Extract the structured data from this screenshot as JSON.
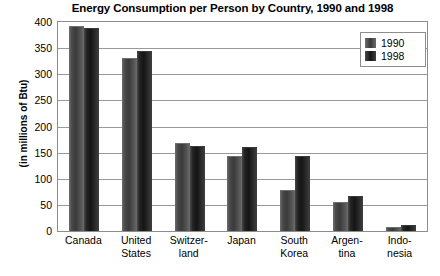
{
  "chart_data": {
    "type": "bar",
    "title": "Energy Consumption per Person by Country, 1990 and 1998",
    "xlabel": "",
    "ylabel": "(in millions of Btu)",
    "ylim": [
      0,
      400
    ],
    "ytick_step": 50,
    "yticks": [
      400,
      350,
      300,
      250,
      200,
      150,
      100,
      50,
      0
    ],
    "grid": true,
    "legend_position": "top-right",
    "categories": [
      "Canada",
      "United States",
      "Switzerland",
      "Japan",
      "South Korea",
      "Argentina",
      "Indonesia"
    ],
    "category_lines": [
      {
        "l1": "Canada",
        "l2": ""
      },
      {
        "l1": "United",
        "l2": "States"
      },
      {
        "l1": "Switzer-",
        "l2": "land"
      },
      {
        "l1": "Japan",
        "l2": ""
      },
      {
        "l1": "South",
        "l2": "Korea"
      },
      {
        "l1": "Argen-",
        "l2": "tina"
      },
      {
        "l1": "Indo-",
        "l2": "nesia"
      }
    ],
    "series": [
      {
        "name": "1990",
        "color": "#3a3a3a",
        "values": [
          392,
          332,
          168,
          143,
          78,
          55,
          7
        ]
      },
      {
        "name": "1998",
        "color": "#151515",
        "values": [
          388,
          345,
          163,
          160,
          143,
          67,
          11
        ]
      }
    ]
  }
}
